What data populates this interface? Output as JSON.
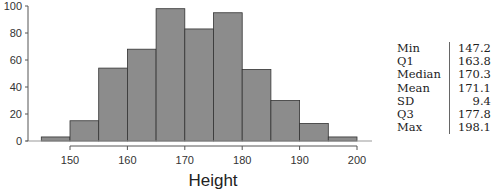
{
  "chart_data": {
    "type": "bar",
    "title": "",
    "xlabel": "Height",
    "ylabel": "",
    "bin_edges": [
      145,
      150,
      155,
      160,
      165,
      170,
      175,
      180,
      185,
      190,
      195,
      200
    ],
    "categories": [
      "145-150",
      "150-155",
      "155-160",
      "160-165",
      "165-170",
      "170-175",
      "175-180",
      "180-185",
      "185-190",
      "190-195",
      "195-200"
    ],
    "values": [
      3,
      15,
      54,
      68,
      98,
      83,
      95,
      53,
      30,
      13,
      3
    ],
    "xticks": [
      150,
      160,
      170,
      180,
      190,
      200
    ],
    "yticks": [
      0,
      20,
      40,
      60,
      80,
      100
    ],
    "xlim": [
      145,
      200
    ],
    "ylim": [
      0,
      100
    ],
    "grid": false,
    "bar_color": "#8c8c8c",
    "edge_color": "#333333"
  },
  "stats_table": {
    "rows": [
      {
        "label": "Min",
        "value": "147.2"
      },
      {
        "label": "Q1",
        "value": "163.8"
      },
      {
        "label": "Median",
        "value": "170.3"
      },
      {
        "label": "Mean",
        "value": "171.1"
      },
      {
        "label": "SD",
        "value": "9.4"
      },
      {
        "label": "Q3",
        "value": "177.8"
      },
      {
        "label": "Max",
        "value": "198.1"
      }
    ]
  }
}
